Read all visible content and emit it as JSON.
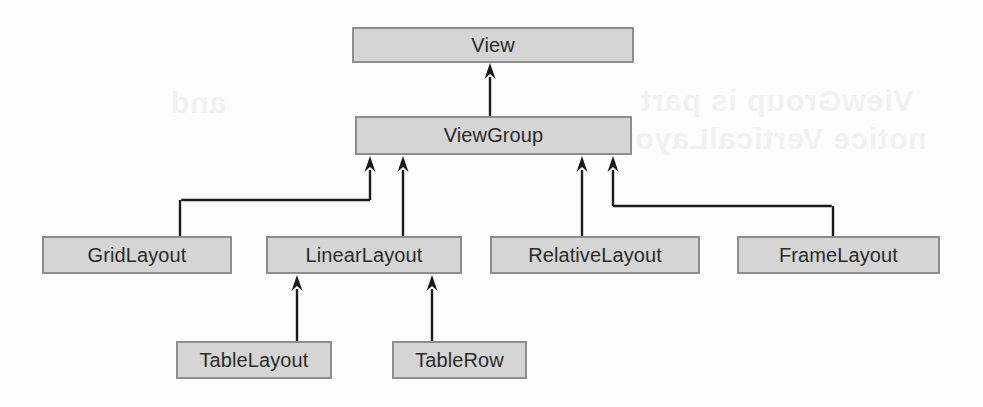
{
  "diagram": {
    "type": "class-inheritance-hierarchy",
    "colors": {
      "background": "#fdfdfd",
      "node_fill": "#d5d5d5",
      "node_border": "#8d8d8d",
      "node_text": "#2b2b2b",
      "edge": "#1a1a1a"
    },
    "ghost_text": [
      {
        "text": "ViewGroup is part",
        "x": 640,
        "y": 84
      },
      {
        "text": "notice VerticalLayout",
        "x": 604,
        "y": 122
      },
      {
        "text": "and",
        "x": 170,
        "y": 86
      }
    ],
    "nodes": [
      {
        "id": "view",
        "label": "View",
        "x": 352,
        "y": 27,
        "w": 282,
        "h": 36
      },
      {
        "id": "viewgroup",
        "label": "ViewGroup",
        "x": 355,
        "y": 116,
        "w": 277,
        "h": 39
      },
      {
        "id": "gridlayout",
        "label": "GridLayout",
        "x": 42,
        "y": 236,
        "w": 190,
        "h": 38
      },
      {
        "id": "linearlayout",
        "label": "LinearLayout",
        "x": 266,
        "y": 236,
        "w": 196,
        "h": 38
      },
      {
        "id": "relativelayout",
        "label": "RelativeLayout",
        "x": 490,
        "y": 236,
        "w": 210,
        "h": 38
      },
      {
        "id": "framelayout",
        "label": "FrameLayout",
        "x": 737,
        "y": 236,
        "w": 203,
        "h": 38
      },
      {
        "id": "tablelayout",
        "label": "TableLayout",
        "x": 176,
        "y": 341,
        "w": 156,
        "h": 38
      },
      {
        "id": "tablerow",
        "label": "TableRow",
        "x": 392,
        "y": 341,
        "w": 135,
        "h": 38
      }
    ],
    "edges": [
      {
        "id": "viewgroup-to-view",
        "from": "viewgroup",
        "to": "view",
        "kind": "straight",
        "x": 490,
        "y_tail": 116,
        "y_head": 63
      },
      {
        "id": "gridlayout-to-viewgroup",
        "from": "gridlayout",
        "to": "viewgroup",
        "kind": "elbow",
        "x_tail": 180,
        "y_tail": 236,
        "y_mid": 200,
        "x_head": 370,
        "y_head": 156
      },
      {
        "id": "linearlayout-to-viewgroup",
        "from": "linearlayout",
        "to": "viewgroup",
        "kind": "straight",
        "x": 403,
        "y_tail": 236,
        "y_head": 156
      },
      {
        "id": "relativelayout-to-viewgroup",
        "from": "relativelayout",
        "to": "viewgroup",
        "kind": "straight",
        "x": 582,
        "y_tail": 236,
        "y_head": 156
      },
      {
        "id": "framelayout-to-viewgroup",
        "from": "framelayout",
        "to": "viewgroup",
        "kind": "elbow",
        "x_tail": 833,
        "y_tail": 236,
        "y_mid": 206,
        "x_head": 613,
        "y_head": 156
      },
      {
        "id": "tablelayout-to-linearlayout",
        "from": "tablelayout",
        "to": "linearlayout",
        "kind": "straight",
        "x": 297,
        "y_tail": 341,
        "y_head": 275
      },
      {
        "id": "tablerow-to-linearlayout",
        "from": "tablerow",
        "to": "linearlayout",
        "kind": "straight",
        "x": 432,
        "y_tail": 341,
        "y_head": 275
      }
    ]
  }
}
